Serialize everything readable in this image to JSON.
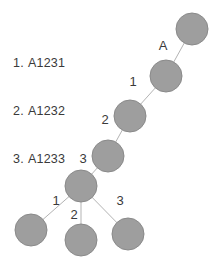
{
  "diagram": {
    "type": "node-link-tree",
    "background_color": "#ffffff",
    "node_fill_color": "#9e9e9e",
    "node_stroke_color": "#8a8a8a",
    "edge_color": "#b3b3b3",
    "label_color": "#3a3a3a",
    "node_radius": 16
  },
  "legend": {
    "items": [
      {
        "number": "1.",
        "code": "A1231"
      },
      {
        "number": "2.",
        "code": "A1232"
      },
      {
        "number": "3.",
        "code": "A1233"
      }
    ]
  },
  "nodes": [
    {
      "id": "n-root",
      "name": "node-root",
      "cx": 192,
      "cy": 29,
      "r": 16
    },
    {
      "id": "n-a",
      "name": "node-a",
      "cx": 166,
      "cy": 76,
      "r": 16
    },
    {
      "id": "n-1",
      "name": "node-level-1",
      "cx": 130,
      "cy": 116,
      "r": 16
    },
    {
      "id": "n-2",
      "name": "node-level-2",
      "cx": 108,
      "cy": 156,
      "r": 16
    },
    {
      "id": "n-3",
      "name": "node-branch",
      "cx": 81,
      "cy": 186,
      "r": 16
    },
    {
      "id": "n-leaf-1",
      "name": "node-leaf-1",
      "cx": 31,
      "cy": 230,
      "r": 16
    },
    {
      "id": "n-leaf-2",
      "name": "node-leaf-2",
      "cx": 81,
      "cy": 240,
      "r": 16
    },
    {
      "id": "n-leaf-3",
      "name": "node-leaf-3",
      "cx": 128,
      "cy": 234,
      "r": 16
    }
  ],
  "edges": [
    {
      "name": "edge-root-a",
      "x1": 192,
      "y1": 29,
      "x2": 166,
      "y2": 76
    },
    {
      "name": "edge-a-1",
      "x1": 166,
      "y1": 76,
      "x2": 130,
      "y2": 116
    },
    {
      "name": "edge-1-2",
      "x1": 130,
      "y1": 116,
      "x2": 108,
      "y2": 156
    },
    {
      "name": "edge-2-branch",
      "x1": 108,
      "y1": 156,
      "x2": 81,
      "y2": 186
    },
    {
      "name": "edge-branch-leaf1",
      "x1": 81,
      "y1": 186,
      "x2": 31,
      "y2": 230
    },
    {
      "name": "edge-branch-leaf2",
      "x1": 81,
      "y1": 186,
      "x2": 81,
      "y2": 240
    },
    {
      "name": "edge-branch-leaf3",
      "x1": 81,
      "y1": 186,
      "x2": 128,
      "y2": 234
    }
  ],
  "edge_labels": [
    {
      "name": "edge-label-a",
      "text": "A",
      "x": 163,
      "y": 45
    },
    {
      "name": "edge-label-1-top",
      "text": "1",
      "x": 133,
      "y": 81
    },
    {
      "name": "edge-label-2-mid",
      "text": "2",
      "x": 105,
      "y": 119
    },
    {
      "name": "edge-label-3-mid",
      "text": "3",
      "x": 83,
      "y": 158
    },
    {
      "name": "edge-label-1-leaf",
      "text": "1",
      "x": 56,
      "y": 200
    },
    {
      "name": "edge-label-2-leaf",
      "text": "2",
      "x": 74,
      "y": 214
    },
    {
      "name": "edge-label-3-leaf",
      "text": "3",
      "x": 120,
      "y": 200
    }
  ]
}
